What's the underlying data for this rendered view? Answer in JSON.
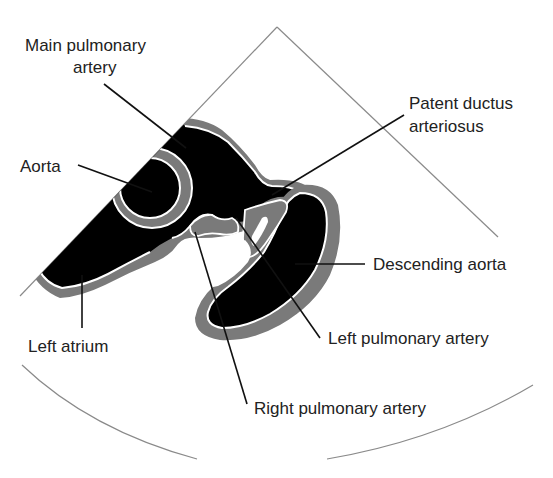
{
  "figure": {
    "type": "echocardiogram-schematic",
    "view": "high parasternal short-axis sector"
  },
  "colors": {
    "lumen": "#000000",
    "wall": "#7a7a7a",
    "endocardium": "#ffffff",
    "sector_outline": "#8a8a8a",
    "leader_line": "#111111",
    "label_text": "#222222"
  },
  "labels": {
    "main_pulmonary_artery_line1": "Main pulmonary",
    "main_pulmonary_artery_line2": "artery",
    "aorta": "Aorta",
    "left_atrium": "Left atrium",
    "patent_ductus_line1": "Patent ductus",
    "patent_ductus_line2": "arteriosus",
    "descending_aorta": "Descending aorta",
    "left_pulmonary_artery": "Left pulmonary artery",
    "right_pulmonary_artery": "Right pulmonary artery"
  }
}
